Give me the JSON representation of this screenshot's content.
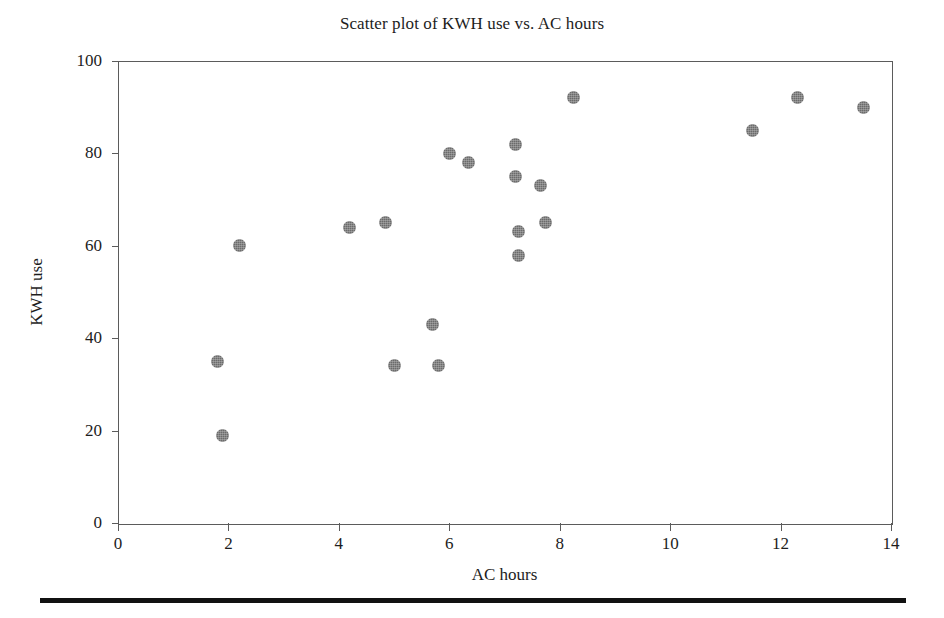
{
  "chart_data": {
    "type": "scatter",
    "title": "Scatter plot of KWH use vs. AC hours",
    "xlabel": "AC hours",
    "ylabel": "KWH use",
    "xlim": [
      0,
      14
    ],
    "ylim": [
      0,
      100
    ],
    "xticks": [
      "0",
      "2",
      "4",
      "6",
      "8",
      "10",
      "12",
      "14"
    ],
    "xtick_values": [
      0,
      2,
      4,
      6,
      8,
      10,
      12,
      14
    ],
    "yticks": [
      "0",
      "20",
      "40",
      "60",
      "80",
      "100"
    ],
    "ytick_values": [
      0,
      20,
      40,
      60,
      80,
      100
    ],
    "grid": false,
    "legend": null,
    "marker": {
      "shape": "circle",
      "color": "#6b6b6b",
      "size_px": 13
    },
    "points": [
      {
        "x": 1.8,
        "y": 35
      },
      {
        "x": 1.9,
        "y": 19
      },
      {
        "x": 2.2,
        "y": 60
      },
      {
        "x": 4.2,
        "y": 64
      },
      {
        "x": 4.85,
        "y": 65
      },
      {
        "x": 5.0,
        "y": 34
      },
      {
        "x": 5.7,
        "y": 43
      },
      {
        "x": 5.8,
        "y": 34
      },
      {
        "x": 6.0,
        "y": 80
      },
      {
        "x": 6.35,
        "y": 78
      },
      {
        "x": 7.2,
        "y": 82
      },
      {
        "x": 7.2,
        "y": 75
      },
      {
        "x": 7.25,
        "y": 63
      },
      {
        "x": 7.25,
        "y": 58
      },
      {
        "x": 7.65,
        "y": 73
      },
      {
        "x": 7.75,
        "y": 65
      },
      {
        "x": 8.25,
        "y": 92
      },
      {
        "x": 11.5,
        "y": 85
      },
      {
        "x": 12.3,
        "y": 92
      },
      {
        "x": 13.5,
        "y": 90
      }
    ]
  },
  "figure": {
    "background_color": "#ffffff",
    "axis_color": "#5b5b5b",
    "rule_color": "#111111"
  }
}
